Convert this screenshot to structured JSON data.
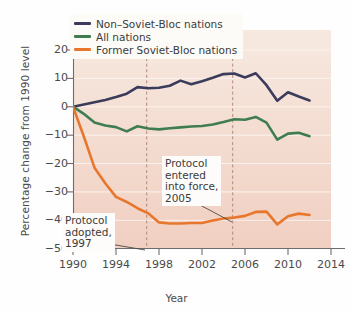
{
  "chart_data": {
    "type": "line",
    "title": "",
    "xlabel": "Year",
    "ylabel": "Percentage change from 1990 level",
    "xlim": [
      1990,
      2014
    ],
    "ylim": [
      -50,
      22
    ],
    "xticks": [
      1990,
      1994,
      1998,
      2002,
      2006,
      2010,
      2014
    ],
    "yticks": [
      20,
      10,
      0,
      -10,
      -20,
      -30,
      -40,
      -50
    ],
    "grid": "horizontal-white",
    "legend_position": "top-left",
    "x": [
      1990,
      1991,
      1992,
      1993,
      1994,
      1995,
      1996,
      1997,
      1998,
      1999,
      2000,
      2001,
      2002,
      2003,
      2004,
      2005,
      2006,
      2007,
      2008,
      2009,
      2010,
      2011,
      2012
    ],
    "series": [
      {
        "name": "Non–Soviet-Bloc nations",
        "color": "#3b3b5c",
        "values": [
          0.0,
          0.8,
          1.6,
          2.4,
          3.4,
          4.6,
          6.9,
          6.5,
          6.7,
          7.4,
          9.2,
          7.9,
          9.0,
          10.2,
          11.5,
          11.7,
          10.3,
          11.8,
          7.6,
          2.1,
          5.1,
          3.6,
          2.2
        ]
      },
      {
        "name": "All nations",
        "color": "#3f7c4f",
        "values": [
          0.0,
          -2.5,
          -5.6,
          -6.6,
          -7.2,
          -8.7,
          -6.9,
          -7.7,
          -8.0,
          -7.6,
          -7.3,
          -7.0,
          -6.8,
          -6.3,
          -5.4,
          -4.4,
          -4.6,
          -3.6,
          -5.6,
          -11.6,
          -9.5,
          -9.2,
          -10.4
        ]
      },
      {
        "name": "Former Soviet-Bloc nations",
        "color": "#e8772e",
        "values": [
          0.0,
          -10.4,
          -21.5,
          -27.0,
          -31.8,
          -33.6,
          -35.8,
          -37.6,
          -40.8,
          -41.2,
          -41.2,
          -41.0,
          -41.0,
          -40.1,
          -39.4,
          -39.1,
          -38.5,
          -37.1,
          -37.0,
          -41.5,
          -38.6,
          -37.7,
          -38.2
        ]
      }
    ],
    "vertical_markers": [
      {
        "x": 1997.3,
        "label": "Protocol adopted, 1997"
      },
      {
        "x": 2005.3,
        "label": "Protocol entered into force, 2005"
      }
    ],
    "annotations": [
      {
        "id": "force",
        "lines": [
          "Protocol",
          "entered",
          "into force,",
          "2005"
        ]
      },
      {
        "id": "adopt",
        "lines": [
          "Protocol",
          "adopted,",
          "1997"
        ]
      }
    ]
  },
  "legend": {
    "items": [
      {
        "label": "Non–Soviet-Bloc nations",
        "color": "#3b3b5c"
      },
      {
        "label": "All nations",
        "color": "#3f7c4f"
      },
      {
        "label": "Former Soviet-Bloc nations",
        "color": "#e8772e"
      }
    ]
  },
  "axes": {
    "y_title": "Percentage change from 1990 level",
    "x_title": "Year",
    "y_tick_labels": [
      "20",
      "10",
      "0",
      "−10",
      "−20",
      "−30",
      "−40",
      "−50"
    ],
    "x_tick_labels": [
      "1990",
      "1994",
      "1998",
      "2002",
      "2006",
      "2010",
      "2014"
    ]
  },
  "annotation_text": {
    "force": "Protocol\nentered\ninto force,\n2005",
    "adopt": "Protocol\nadopted,\n1997"
  }
}
